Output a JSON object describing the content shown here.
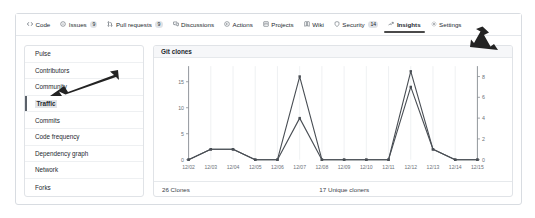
{
  "nav": {
    "tabs": [
      {
        "label": "Code",
        "icon": "code-icon",
        "badge": "",
        "selected": false
      },
      {
        "label": "Issues",
        "icon": "issue-opened-icon",
        "badge": "9",
        "selected": false
      },
      {
        "label": "Pull requests",
        "icon": "git-pull-request-icon",
        "badge": "9",
        "selected": false
      },
      {
        "label": "Discussions",
        "icon": "comment-discussion-icon",
        "badge": "",
        "selected": false
      },
      {
        "label": "Actions",
        "icon": "play-icon",
        "badge": "",
        "selected": false
      },
      {
        "label": "Projects",
        "icon": "project-icon",
        "badge": "",
        "selected": false
      },
      {
        "label": "Wiki",
        "icon": "book-icon",
        "badge": "",
        "selected": false
      },
      {
        "label": "Security",
        "icon": "shield-icon",
        "badge": "14",
        "selected": false
      },
      {
        "label": "Insights",
        "icon": "graph-icon",
        "badge": "",
        "selected": true
      },
      {
        "label": "Settings",
        "icon": "gear-icon",
        "badge": "",
        "selected": false
      }
    ]
  },
  "sidebar": {
    "items": [
      {
        "label": "Pulse",
        "selected": false
      },
      {
        "label": "Contributors",
        "selected": false
      },
      {
        "label": "Community",
        "selected": false
      },
      {
        "label": "Traffic",
        "selected": true
      },
      {
        "label": "Commits",
        "selected": false
      },
      {
        "label": "Code frequency",
        "selected": false
      },
      {
        "label": "Dependency graph",
        "selected": false
      },
      {
        "label": "Network",
        "selected": false
      },
      {
        "label": "Forks",
        "selected": false
      }
    ]
  },
  "panel": {
    "title": "Git clones",
    "footer_left": "26 Clones",
    "footer_right": "17 Unique cloners"
  },
  "colors": {
    "line": "#4a4f55",
    "grid": "#e9ebee",
    "axis": "#8b9096",
    "tab_underline": "#4a4a4a",
    "sidebar_selected": "#5b6169",
    "panel_head_bg": "#f6f7f9"
  },
  "chart_data": {
    "type": "line",
    "title": "Git clones",
    "xlabel": "",
    "ylabel": "",
    "grid": true,
    "legend": false,
    "x": [
      "12/02",
      "12/03",
      "12/04",
      "12/05",
      "12/06",
      "12/07",
      "12/08",
      "12/09",
      "12/10",
      "12/11",
      "12/12",
      "12/13",
      "12/14",
      "12/15"
    ],
    "left_axis": {
      "label": "Clones",
      "ticks": [
        0,
        5,
        10,
        15
      ],
      "ylim": [
        0,
        18
      ]
    },
    "right_axis": {
      "label": "Unique cloners",
      "ticks": [
        0,
        2,
        4,
        6,
        8
      ],
      "ylim": [
        0,
        9
      ]
    },
    "series": [
      {
        "name": "Clones",
        "axis": "left",
        "values": [
          0,
          2,
          2,
          0,
          0,
          16,
          0,
          0,
          0,
          0,
          17,
          2,
          0,
          0
        ]
      },
      {
        "name": "Unique cloners",
        "axis": "right",
        "values": [
          0,
          1,
          1,
          0,
          0,
          4,
          0,
          0,
          0,
          0,
          7,
          1,
          0,
          0
        ]
      }
    ]
  }
}
